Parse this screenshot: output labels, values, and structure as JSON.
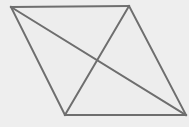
{
  "figure": {
    "name": "parallelogram-with-diagonals",
    "canvas": {
      "width": 189,
      "height": 127
    },
    "colors": {
      "background": "#eeeeee",
      "stroke": "#6e6e6e",
      "fill": "#ededed"
    },
    "stroke_width": 2,
    "vertices": [
      {
        "id": "A",
        "label": "",
        "x": 11,
        "y": 7
      },
      {
        "id": "B",
        "label": "",
        "x": 129,
        "y": 6
      },
      {
        "id": "C",
        "label": "",
        "x": 186,
        "y": 115
      },
      {
        "id": "D",
        "label": "",
        "x": 65,
        "y": 115
      }
    ],
    "intersection": {
      "id": "E",
      "label": "",
      "x": 97,
      "y": 62
    },
    "edges": [
      {
        "name": "top-edge",
        "from": "A",
        "to": "B",
        "path": "M 11 7 L 129 6"
      },
      {
        "name": "right-edge",
        "from": "B",
        "to": "C",
        "path": "M 129 6 L 186 115"
      },
      {
        "name": "bottom-edge",
        "from": "C",
        "to": "D",
        "path": "M 186 115 L 65 115"
      },
      {
        "name": "left-edge",
        "from": "D",
        "to": "A",
        "path": "M 65 115 L 11 7"
      }
    ],
    "diagonals": [
      {
        "name": "diagonal-a-c",
        "from": "A",
        "to": "C",
        "path": "M 11 7 L 186 115"
      },
      {
        "name": "diagonal-b-d",
        "from": "B",
        "to": "D",
        "path": "M 129 6 L 65 115"
      }
    ],
    "outline_path": "M 11 7 L 129 6 L 186 115 L 65 115 Z"
  }
}
